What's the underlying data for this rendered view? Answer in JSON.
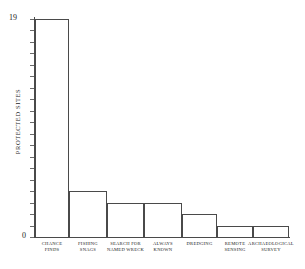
{
  "chart_data": {
    "type": "bar",
    "title": "",
    "subtitle": "",
    "xlabel": "",
    "ylabel": "PROTECTED SITES",
    "categories": [
      "CHANCE FINDS",
      "FISHING SNAGS",
      "SEARCH FOR NAMED WRECK",
      "ALWAYS KNOWN",
      "DREDGING",
      "REMOTE SENSING",
      "ARCHAEOLOGICAL SURVEY"
    ],
    "category_lines": [
      [
        "CHANCE",
        "FINDS"
      ],
      [
        "FISHING",
        "SNAGS"
      ],
      [
        "SEARCH FOR",
        "NAMED WRECK"
      ],
      [
        "ALWAYS",
        "KNOWN"
      ],
      [
        "DREDGING"
      ],
      [
        "REMOTE",
        "SENSING"
      ],
      [
        "ARCHAEOLOGICAL",
        "SURVEY"
      ]
    ],
    "values": [
      19,
      4,
      3,
      3,
      2,
      1,
      1
    ],
    "ylim": [
      0,
      19
    ],
    "ytick_labels": [
      "0",
      "19"
    ],
    "ytick_count": 20,
    "grid": false,
    "legend": null,
    "bar_style": "outline",
    "colors": {
      "line": "#4a4a4a",
      "text": "#1a1a1a",
      "background": "#ffffff"
    }
  }
}
